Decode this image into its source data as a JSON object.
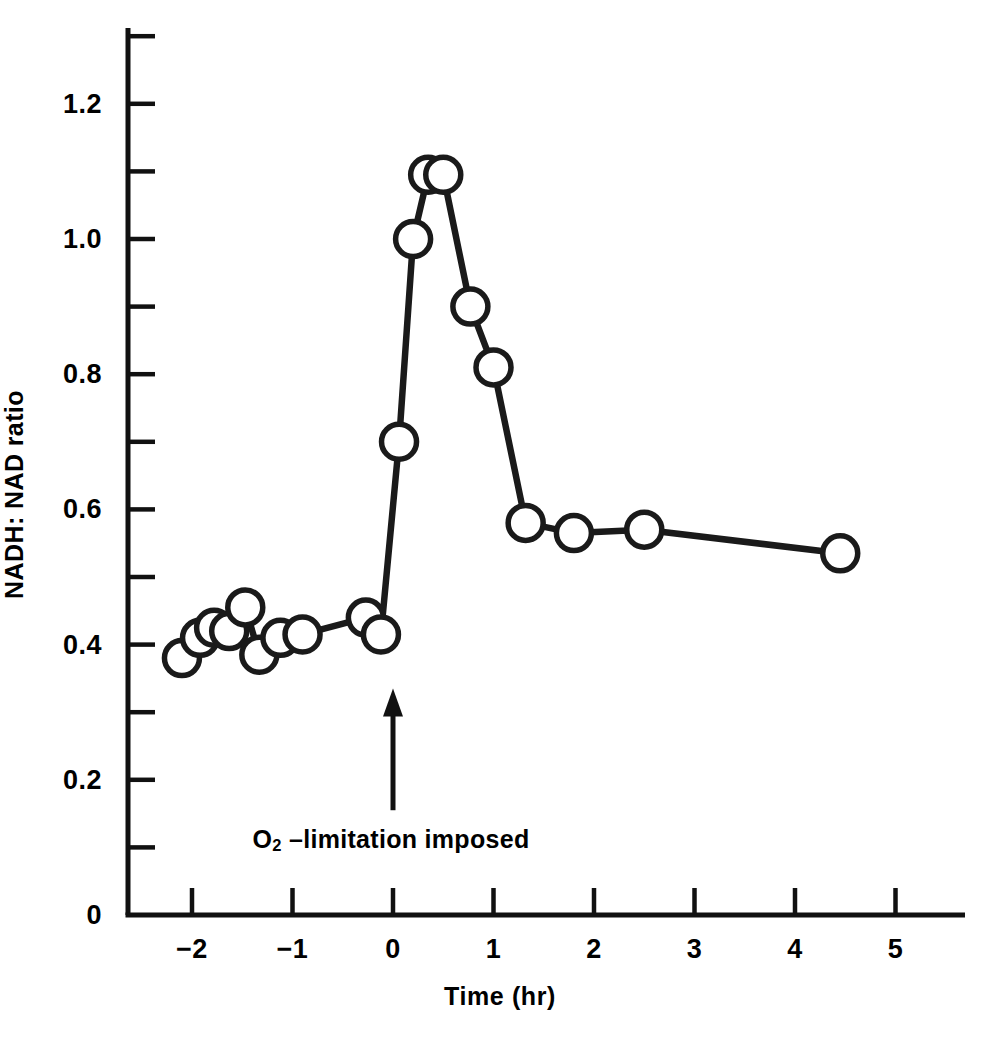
{
  "chart_data": {
    "type": "line",
    "title": "",
    "subtitle": "",
    "xlabel": "Time (hr)",
    "ylabel": "NADH: NAD ratio",
    "xlim": [
      -2.65,
      5.85
    ],
    "ylim": [
      0,
      1.31
    ],
    "grid": false,
    "legend": null,
    "x_major_ticks": [
      -2,
      -1,
      0,
      1,
      2,
      3,
      4,
      5
    ],
    "x_major_tick_labels": [
      "−2",
      "−1",
      "0",
      "1",
      "2",
      "3",
      "4",
      "5"
    ],
    "y_major_ticks": [
      0,
      0.2,
      0.4,
      0.6,
      0.8,
      1.0,
      1.2
    ],
    "y_major_tick_labels": [
      "0",
      "0.2",
      "0.4",
      "0.6",
      "0.8",
      "1.0",
      "1.2"
    ],
    "y_minor_ticks": [
      0.1,
      0.3,
      0.5,
      0.7,
      0.9,
      1.1,
      1.3
    ],
    "marker": "open-circle",
    "marker_face_color": "#ffffff",
    "marker_edge_color": "#1a1a1a",
    "line_color": "#1a1a1a",
    "series": [
      {
        "name": "NADH: NAD ratio",
        "x": [
          -2.1,
          -1.92,
          -1.78,
          -1.63,
          -1.47,
          -1.33,
          -1.12,
          -0.9,
          -0.27,
          -0.12,
          0.06,
          0.2,
          0.35,
          0.5,
          0.77,
          1.0,
          1.32,
          1.8,
          2.5,
          4.45
        ],
        "y": [
          0.38,
          0.41,
          0.425,
          0.42,
          0.455,
          0.385,
          0.41,
          0.415,
          0.44,
          0.415,
          0.7,
          1.0,
          1.095,
          1.095,
          0.9,
          0.81,
          0.58,
          0.565,
          0.57,
          0.535
        ]
      }
    ],
    "annotations": [
      {
        "name": "o2-limitation",
        "text_prefix": "O",
        "text_subscript": "2",
        "text_suffix": " –limitation imposed",
        "full_text": "O2 –limitation imposed",
        "arrow_x": 0,
        "arrow_tail_y": 0.155,
        "arrow_head_y": 0.335
      }
    ]
  },
  "axes": {
    "y_title": "NADH: NAD ratio",
    "x_title": "Time (hr)"
  }
}
